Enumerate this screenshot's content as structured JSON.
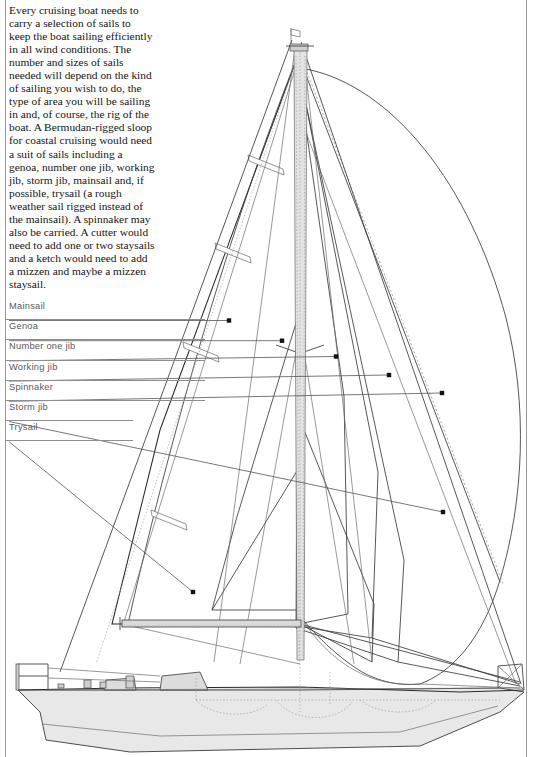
{
  "page": {
    "width": 534,
    "height": 757,
    "background": "#ffffff",
    "border_color": "#9a9a9a"
  },
  "body_copy": {
    "text": "Every cruising boat needs to carry a selection of sails to keep the boat sailing efficiently in all wind conditions. The number and sizes of sails needed will depend on the kind of sailing you wish to do, the type of area you will be sailing in and, of course, the rig of the boat. A Bermudan-rigged sloop for coastal cruising would need a suit of sails including a genoa, number one jib, working jib, storm jib, mainsail and, if possible, trysail (a rough weather sail rigged instead of the mainsail). A spinnaker may also be carried. A cutter would need to add one or two staysails and a ketch would need to add a mizzen and maybe a mizzen staysail."
  },
  "legend": {
    "text_color": "#595959",
    "rule_color": "#8e8e8e",
    "items": [
      {
        "label": "Mainsail",
        "rule_width": 230,
        "leader": {
          "x1": 9,
          "y1": 320.5,
          "x2": 229,
          "y2": 320.5,
          "dot_x": 229,
          "dot_y": 320.5
        }
      },
      {
        "label": "Genoa",
        "rule_width": 283,
        "leader": {
          "x1": 9,
          "y1": 340.7,
          "x2": 282,
          "y2": 340.7,
          "dot_x": 282,
          "dot_y": 340.7
        }
      },
      {
        "label": "Number one jib",
        "rule_width": 337,
        "leader": {
          "x1": 9,
          "y1": 360.9,
          "x2": 336,
          "y2": 356.5,
          "dot_x": 336,
          "dot_y": 356.5
        }
      },
      {
        "label": "Working jib",
        "rule_width": 390,
        "leader": {
          "x1": 9,
          "y1": 381.1,
          "x2": 389,
          "y2": 375.0,
          "dot_x": 389,
          "dot_y": 375.0
        }
      },
      {
        "label": "Spinnaker",
        "rule_width": 443,
        "leader": {
          "x1": 9,
          "y1": 401.3,
          "x2": 442,
          "y2": 393.0,
          "dot_x": 442,
          "dot_y": 393.0
        }
      },
      {
        "label": "Storm jib",
        "rule_width": 128,
        "leader": {
          "x1": 9,
          "y1": 421.5,
          "x2": 443,
          "y2": 512.0,
          "dot_x": 443,
          "dot_y": 512.0
        }
      },
      {
        "label": "Trysail",
        "rule_width": 128,
        "leader": {
          "x1": 9,
          "y1": 441.7,
          "x2": 193,
          "y2": 592.0,
          "dot_x": 193,
          "dot_y": 592.0
        }
      }
    ]
  },
  "diagram": {
    "type": "technical-line-drawing",
    "mast": {
      "x": 300,
      "top_y": 55,
      "bottom_y": 660,
      "head_x": 291,
      "truck_y": 32
    },
    "boom": {
      "x1": 122,
      "x2": 301,
      "y": 624
    },
    "sails_depicted": [
      "mainsail",
      "genoa",
      "number one jib",
      "working jib",
      "spinnaker",
      "storm jib",
      "trysail"
    ],
    "hull": {
      "bow_x": 18,
      "stern_x": 524,
      "deck_y": 690,
      "keel_y": 745
    },
    "fittings": [
      "bow-pulpit",
      "stern-pushpit",
      "winches",
      "deck-vents",
      "coachroof"
    ],
    "masthead_device": "wind-vane-burgee",
    "line_color": "#3a3a3a",
    "hull_fill": "#e8e8e8",
    "mast_fill": "#e3e3e3"
  }
}
